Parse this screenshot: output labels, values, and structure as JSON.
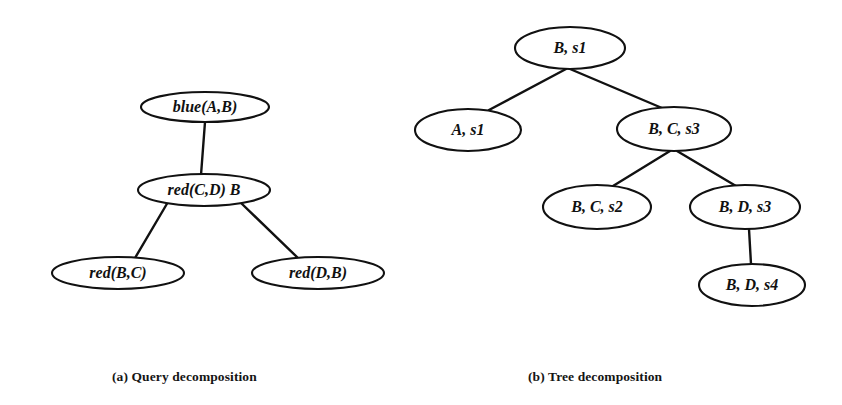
{
  "figure": {
    "background_color": "#ffffff",
    "ink_color": "#111111",
    "panels": [
      {
        "id": "query-decomposition",
        "caption": "(a) Query decomposition",
        "nodes": [
          {
            "id": "a-root",
            "label": "blue(A,B)",
            "cx": 205,
            "cy": 107,
            "rx": 64,
            "ry": 15
          },
          {
            "id": "a-mid",
            "label": "red(C,D)  B",
            "cx": 204,
            "cy": 190,
            "rx": 66,
            "ry": 16
          },
          {
            "id": "a-left",
            "label": "red(B,C)",
            "cx": 118,
            "cy": 273,
            "rx": 66,
            "ry": 16
          },
          {
            "id": "a-right",
            "label": "red(D,B)",
            "cx": 318,
            "cy": 273,
            "rx": 66,
            "ry": 16
          }
        ],
        "edges": [
          {
            "from": "a-root",
            "to": "a-mid",
            "x1": 205,
            "y1": 122,
            "x2": 201,
            "y2": 175
          },
          {
            "from": "a-mid",
            "to": "a-left",
            "x1": 168,
            "y1": 202,
            "x2": 135,
            "y2": 258
          },
          {
            "from": "a-mid",
            "to": "a-right",
            "x1": 240,
            "y1": 202,
            "x2": 299,
            "y2": 259
          }
        ]
      },
      {
        "id": "tree-decomposition",
        "caption": "(b) Tree decomposition",
        "nodes": [
          {
            "id": "b-root",
            "label": "B, s1",
            "cx": 570,
            "cy": 48,
            "rx": 55,
            "ry": 21
          },
          {
            "id": "b-a-s1",
            "label": "A, s1",
            "cx": 468,
            "cy": 130,
            "rx": 53,
            "ry": 21
          },
          {
            "id": "b-bcs3",
            "label": "B, C, s3",
            "cx": 674,
            "cy": 129,
            "rx": 57,
            "ry": 22
          },
          {
            "id": "b-bcs2",
            "label": "B, C, s2",
            "cx": 597,
            "cy": 207,
            "rx": 54,
            "ry": 22
          },
          {
            "id": "b-bds3",
            "label": "B, D, s3",
            "cx": 745,
            "cy": 207,
            "rx": 55,
            "ry": 22
          },
          {
            "id": "b-bds4",
            "label": "B, D, s4",
            "cx": 752,
            "cy": 285,
            "rx": 53,
            "ry": 21
          }
        ],
        "edges": [
          {
            "from": "b-root",
            "to": "b-a-s1",
            "x1": 566,
            "y1": 69,
            "x2": 489,
            "y2": 110
          },
          {
            "from": "b-root",
            "to": "b-bcs3",
            "x1": 570,
            "y1": 69,
            "x2": 662,
            "y2": 108
          },
          {
            "from": "b-bcs3",
            "to": "b-bcs2",
            "x1": 670,
            "y1": 151,
            "x2": 613,
            "y2": 186
          },
          {
            "from": "b-bcs3",
            "to": "b-bds3",
            "x1": 677,
            "y1": 151,
            "x2": 736,
            "y2": 186
          },
          {
            "from": "b-bds3",
            "to": "b-bds4",
            "x1": 749,
            "y1": 229,
            "x2": 751,
            "y2": 264
          }
        ]
      }
    ]
  }
}
